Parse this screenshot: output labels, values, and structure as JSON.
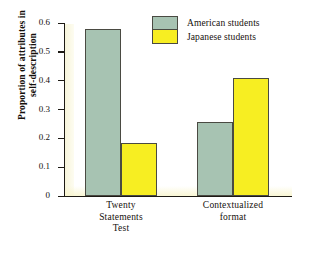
{
  "chart_data": {
    "type": "bar",
    "title": "",
    "xlabel": "",
    "ylabel": "Proportion of attributes in self-description",
    "ylim": [
      0,
      0.6
    ],
    "yticks": [
      "0.6",
      "0.5",
      "0.4",
      "0.3",
      "0.2",
      "0.1",
      "0"
    ],
    "grid": false,
    "legend_position": "top-right",
    "categories": [
      "Twenty Statements Test",
      "Contextualized format"
    ],
    "category_lines": [
      [
        "Twenty",
        "Statements",
        "Test"
      ],
      [
        "Contextualized",
        "format"
      ]
    ],
    "series": [
      {
        "name": "American students",
        "color": "#a7c3b2",
        "values": [
          0.58,
          0.257
        ]
      },
      {
        "name": "Japanese students",
        "color": "#f7ee22",
        "values": [
          0.185,
          0.408
        ]
      }
    ]
  },
  "axis": {
    "ylabel_line1": "Proportion of attributes in",
    "ylabel_line2": "self-description"
  },
  "legend": {
    "items": [
      {
        "label": "American students",
        "color": "#a7c3b2"
      },
      {
        "label": "Japanese students",
        "color": "#f7ee22"
      }
    ]
  },
  "colors": {
    "american": "#a7c3b2",
    "japanese": "#f7ee22",
    "axis": "#1d1a14",
    "bar_outline": "#4a4a42",
    "background": "#ffffff"
  }
}
